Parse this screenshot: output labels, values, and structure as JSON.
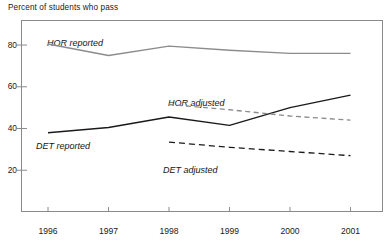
{
  "chart_data": {
    "type": "line",
    "title": "Percent of students who pass",
    "xlabel": "",
    "ylabel": "",
    "x": [
      "1996",
      "1997",
      "1998",
      "1999",
      "2000",
      "2001"
    ],
    "xlim": [
      1995.5,
      2001.5
    ],
    "ylim": [
      0,
      92
    ],
    "yticks": [
      20,
      40,
      60,
      80
    ],
    "ytick_labels": [
      "20",
      "40",
      "60",
      "80"
    ],
    "grid": false,
    "legend": "inline-annotations",
    "series": [
      {
        "name": "HOR reported",
        "style": "solid",
        "color": "#8c8c8c",
        "x": [
          "1996",
          "1997",
          "1998",
          "1999",
          "2000",
          "2001"
        ],
        "values": [
          80.5,
          75.0,
          79.5,
          77.5,
          76.0,
          76.0
        ]
      },
      {
        "name": "DET reported",
        "style": "solid",
        "color": "#1a1a1a",
        "x": [
          "1996",
          "1997",
          "1998",
          "1999",
          "2000",
          "2001"
        ],
        "values": [
          38.0,
          40.5,
          45.5,
          41.5,
          50.0,
          56.0
        ]
      },
      {
        "name": "HOR adjusted",
        "style": "dashed",
        "color": "#8c8c8c",
        "x": [
          "1998",
          "1999",
          "2000",
          "2001"
        ],
        "values": [
          51.5,
          49.0,
          46.0,
          44.0
        ]
      },
      {
        "name": "DET adjusted",
        "style": "dashed",
        "color": "#1a1a1a",
        "x": [
          "1998",
          "1999",
          "2000",
          "2001"
        ],
        "values": [
          33.5,
          31.0,
          29.0,
          27.0
        ]
      }
    ],
    "annotations": [
      {
        "text": "HOR reported",
        "series": "HOR reported"
      },
      {
        "text": "HOR adjusted",
        "series": "HOR adjusted"
      },
      {
        "text": "DET reported",
        "series": "DET reported"
      },
      {
        "text": "DET adjusted",
        "series": "DET adjusted"
      }
    ]
  },
  "axes": {
    "title": "Percent of students who pass",
    "ytick_labels": [
      "80",
      "60",
      "40",
      "20"
    ],
    "xtick_labels": [
      "1996",
      "1997",
      "1998",
      "1999",
      "2000",
      "2001"
    ]
  },
  "labels": {
    "hor_reported": "HOR reported",
    "hor_adjusted": "HOR adjusted",
    "det_reported": "DET reported",
    "det_adjusted": "DET adjusted"
  },
  "colors": {
    "reported_hor": "#8c8c8c",
    "reported_det": "#1a1a1a",
    "frame": "#8a8a8a",
    "background": "#ffffff"
  }
}
